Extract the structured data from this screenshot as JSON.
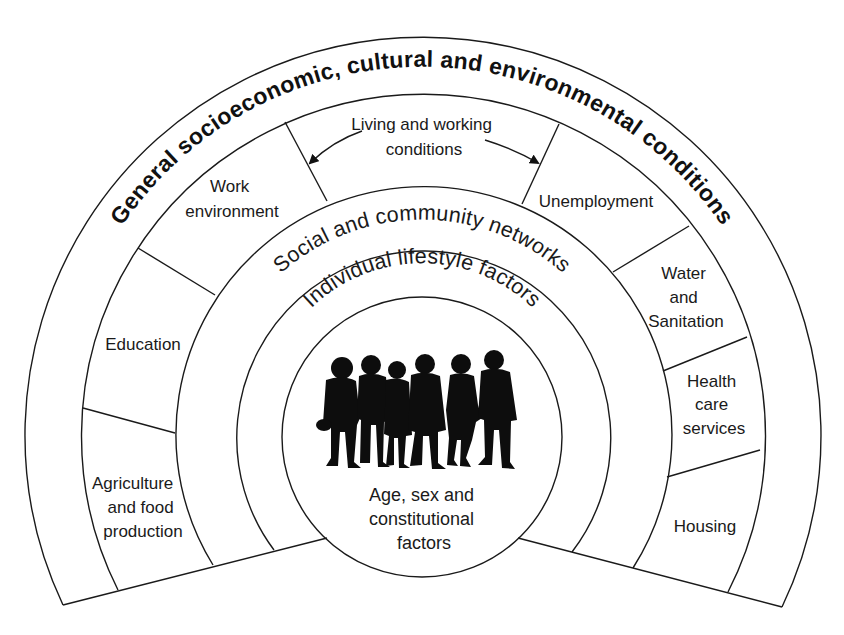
{
  "diagram": {
    "title": "General socioeconomic, cultural and environmental conditions",
    "layers": {
      "social": "Social and community networks",
      "individual": "Individual lifestyle factors",
      "core": [
        "Age, sex and",
        "constitutional",
        "factors"
      ]
    },
    "living_working": {
      "label": [
        "Living and working",
        "conditions"
      ]
    },
    "segments": {
      "agriculture": [
        "Agriculture",
        "and food",
        "production"
      ],
      "education": [
        "Education"
      ],
      "work": [
        "Work",
        "environment"
      ],
      "unemployment": [
        "Unemployment"
      ],
      "water": [
        "Water",
        "and",
        "Sanitation"
      ],
      "health": [
        "Health",
        "care",
        "services"
      ],
      "housing": [
        "Housing"
      ]
    },
    "icons": {
      "people": "people-silhouettes-icon",
      "arrow_left": "arrow-left-icon",
      "arrow_right": "arrow-right-icon"
    },
    "colors": {
      "line": "#1a1a1a",
      "background": "#ffffff",
      "silhouette": "#0d0d0d"
    }
  }
}
